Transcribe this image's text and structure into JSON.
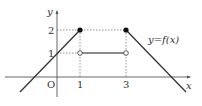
{
  "diagram": {
    "type": "function-graph",
    "function_label": "y=f(x)",
    "axes": {
      "x_label": "x",
      "y_label": "y",
      "origin_label": "O",
      "x_ticks": [
        "1",
        "3"
      ],
      "y_ticks": [
        "1",
        "2"
      ]
    },
    "pieces": [
      {
        "kind": "line",
        "from": [
          -2.8,
          -0.7
        ],
        "to": [
          1,
          2
        ],
        "endpoint": "closed"
      },
      {
        "kind": "segment",
        "from": [
          1,
          1
        ],
        "to": [
          3,
          1
        ],
        "left_endpoint": "open",
        "right_endpoint": "open"
      },
      {
        "kind": "line",
        "from": [
          3,
          2
        ],
        "to": [
          5.6,
          -0.7
        ],
        "endpoint": "closed"
      }
    ],
    "points": [
      {
        "x": 1,
        "y": 2,
        "style": "filled"
      },
      {
        "x": 3,
        "y": 2,
        "style": "filled"
      },
      {
        "x": 1,
        "y": 1,
        "style": "open"
      },
      {
        "x": 3,
        "y": 1,
        "style": "open"
      }
    ],
    "colors": {
      "axis": "#555555",
      "curve": "#333333",
      "guide": "#666666"
    }
  }
}
